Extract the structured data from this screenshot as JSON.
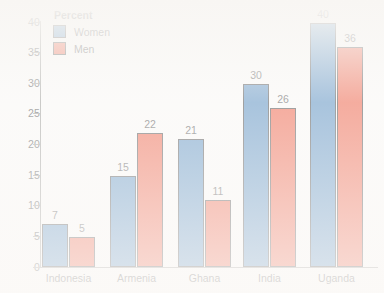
{
  "chart_data": {
    "type": "bar",
    "title": "",
    "subtitle": "",
    "xlabel": "",
    "ylabel": "Percent",
    "legend_title": "Percent",
    "legend_position": "top-left",
    "grid": false,
    "categories": [
      "Indonesia",
      "Armenia",
      "Ghana",
      "India",
      "Uganda"
    ],
    "series": [
      {
        "name": "Women",
        "color": "#3f7cb4",
        "values": [
          7,
          15,
          21,
          30,
          40
        ]
      },
      {
        "name": "Men",
        "color": "#e8482a",
        "values": [
          5,
          22,
          11,
          26,
          36
        ]
      }
    ],
    "ylim": [
      0,
      40
    ],
    "ytick_labels": [
      "40",
      "35",
      "30",
      "25",
      "20",
      "15",
      "10",
      "5",
      "0"
    ],
    "ytick_values": [
      40,
      35,
      30,
      25,
      20,
      15,
      10,
      5,
      0
    ],
    "axis_color": "#8b8b86",
    "background_color": "#f7f5f2",
    "bar_outline_color": "#2c2c2c"
  }
}
